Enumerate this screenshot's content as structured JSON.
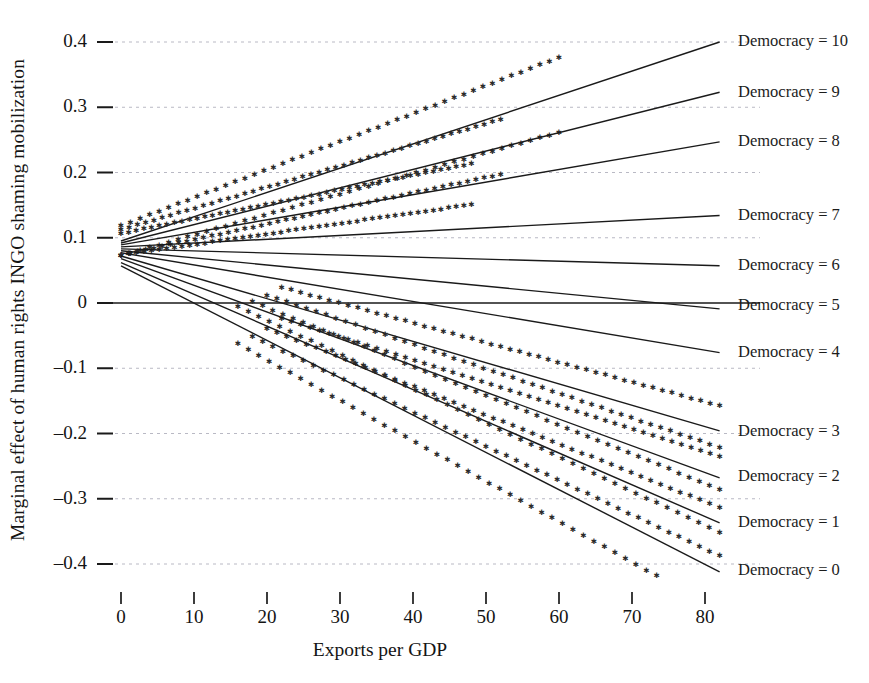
{
  "chart_data": {
    "type": "line",
    "title": "",
    "xlabel": "Exports per GDP",
    "ylabel": "Marginal effect of human rights INGO shaming mobilization",
    "xlim": [
      0,
      82
    ],
    "ylim": [
      -0.42,
      0.42
    ],
    "xticks": [
      0,
      10,
      20,
      30,
      40,
      50,
      60,
      70,
      80
    ],
    "xtick_labels": [
      "0",
      "10",
      "20",
      "30",
      "40",
      "50",
      "60",
      "70",
      "80"
    ],
    "yticks": [
      0.4,
      0.3,
      0.2,
      0.1,
      0,
      -0.1,
      -0.2,
      -0.3,
      -0.4
    ],
    "ytick_labels": [
      "0.4",
      "0.3",
      "0.2",
      "0.1",
      "0",
      "–0.1",
      "–0.2",
      "–0.3",
      "–0.4"
    ],
    "grid": true,
    "grid_style": "dashed",
    "zero_line": true,
    "legend_position": "right-inline-end-of-line",
    "line_color": "#1a1a1a",
    "grid_color": "#b9b9c4",
    "ci_marker": "star",
    "ci_marker_color": "#2a2a2a",
    "series": [
      {
        "name": "Democracy = 10",
        "label": "Democracy = 10",
        "x": [
          0,
          82
        ],
        "values": [
          0.095,
          0.4
        ],
        "ci_upper": [
          0.118,
          0.47
        ],
        "ci_lower": [
          0.072,
          0.33
        ],
        "ci_shown": true,
        "ci_visible_x": [
          0,
          60
        ],
        "label_y": 0.4
      },
      {
        "name": "Democracy = 9",
        "label": "Democracy = 9",
        "x": [
          0,
          82
        ],
        "values": [
          0.092,
          0.323
        ],
        "ci_upper": [
          0.112,
          0.378
        ],
        "ci_lower": [
          0.073,
          0.268
        ],
        "ci_shown": true,
        "ci_visible_x": [
          0,
          52
        ],
        "label_y": 0.322
      },
      {
        "name": "Democracy = 8",
        "label": "Democracy = 8",
        "x": [
          0,
          82
        ],
        "values": [
          0.089,
          0.247
        ],
        "ci_upper": [
          0.106,
          0.289
        ],
        "ci_lower": [
          0.073,
          0.205
        ],
        "ci_shown": true,
        "ci_visible_x": [
          0,
          48
        ],
        "label_y": 0.246
      },
      {
        "name": "Democracy = 7",
        "label": "Democracy = 7",
        "x": [
          0,
          82
        ],
        "values": [
          0.086,
          0.134
        ],
        "ci_shown": false,
        "label_y": 0.133
      },
      {
        "name": "Democracy = 6",
        "label": "Democracy = 6",
        "x": [
          0,
          82
        ],
        "values": [
          0.083,
          0.057
        ],
        "ci_shown": false,
        "label_y": 0.056
      },
      {
        "name": "Democracy = 5",
        "label": "Democracy = 5",
        "x": [
          0,
          82
        ],
        "values": [
          0.08,
          -0.009
        ],
        "ci_shown": false,
        "label_y": -0.005
      },
      {
        "name": "Democracy = 4",
        "label": "Democracy = 4",
        "x": [
          0,
          82
        ],
        "values": [
          0.077,
          -0.076
        ],
        "ci_shown": false,
        "label_y": -0.077
      },
      {
        "name": "Democracy = 3",
        "label": "Democracy = 3",
        "x": [
          0,
          82
        ],
        "values": [
          0.072,
          -0.196
        ],
        "ci_upper": [
          0.09,
          -0.158
        ],
        "ci_lower": [
          0.054,
          -0.235
        ],
        "ci_shown": true,
        "ci_visible_x": [
          22,
          82
        ],
        "label_y": -0.198
      },
      {
        "name": "Democracy = 2",
        "label": "Democracy = 2",
        "x": [
          0,
          82
        ],
        "values": [
          0.068,
          -0.268
        ],
        "ci_upper": [
          0.087,
          -0.222
        ],
        "ci_lower": [
          0.049,
          -0.314
        ],
        "ci_shown": true,
        "ci_visible_x": [
          20,
          82
        ],
        "label_y": -0.266
      },
      {
        "name": "Democracy = 1",
        "label": "Democracy = 1",
        "x": [
          0,
          82
        ],
        "values": [
          0.062,
          -0.337
        ],
        "ci_upper": [
          0.082,
          -0.286
        ],
        "ci_lower": [
          0.042,
          -0.388
        ],
        "ci_shown": true,
        "ci_visible_x": [
          18,
          82
        ],
        "label_y": -0.337
      },
      {
        "name": "Democracy = 0",
        "label": "Democracy = 0",
        "x": [
          0,
          82
        ],
        "values": [
          0.057,
          -0.412
        ],
        "ci_upper": [
          0.078,
          -0.352
        ],
        "ci_lower": [
          0.036,
          -0.472
        ],
        "ci_shown": true,
        "ci_visible_x": [
          16,
          82
        ],
        "label_y": -0.41
      }
    ]
  }
}
